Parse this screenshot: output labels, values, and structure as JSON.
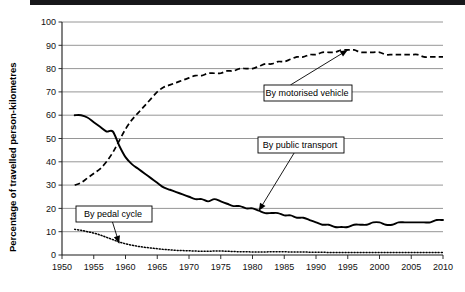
{
  "chart_data": {
    "type": "line",
    "title": "",
    "xlabel": "",
    "ylabel": "Percentage of travelled person-kilometres",
    "xlim": [
      1950,
      2010
    ],
    "ylim": [
      0,
      100
    ],
    "grid": true,
    "legend_position": "inline-annotations",
    "x_ticks": [
      "1950",
      "1955",
      "1960",
      "1965",
      "1970",
      "1975",
      "1980",
      "1985",
      "1990",
      "1995",
      "2000",
      "2005",
      "2010"
    ],
    "y_ticks": [
      "0",
      "10",
      "20",
      "30",
      "40",
      "50",
      "60",
      "70",
      "80",
      "90",
      "100"
    ],
    "annotations": [
      {
        "label": "By motorised vehicle",
        "points_to_year": 1995,
        "points_to_value": 88
      },
      {
        "label": "By public transport",
        "points_to_year": 1981,
        "points_to_value": 19
      },
      {
        "label": "By pedal cycle",
        "points_to_year": 1959,
        "points_to_value": 5
      }
    ],
    "series": [
      {
        "name": "By motorised vehicle",
        "style": "dashed",
        "x": [
          1952,
          1953,
          1954,
          1955,
          1956,
          1957,
          1958,
          1959,
          1960,
          1961,
          1962,
          1963,
          1964,
          1965,
          1966,
          1967,
          1968,
          1969,
          1970,
          1971,
          1972,
          1973,
          1974,
          1975,
          1976,
          1977,
          1978,
          1979,
          1980,
          1981,
          1982,
          1983,
          1984,
          1985,
          1986,
          1987,
          1988,
          1989,
          1990,
          1991,
          1992,
          1993,
          1994,
          1995,
          1996,
          1997,
          1998,
          1999,
          2000,
          2001,
          2002,
          2003,
          2004,
          2005,
          2006,
          2007,
          2008,
          2009,
          2010
        ],
        "values": [
          30,
          31,
          33,
          35,
          37,
          40,
          44,
          49,
          54,
          58,
          61,
          64,
          67,
          70,
          72,
          73,
          74,
          75,
          76,
          77,
          77,
          78,
          78,
          78,
          79,
          79,
          80,
          80,
          80,
          81,
          82,
          82,
          83,
          83,
          84,
          85,
          85,
          86,
          86,
          87,
          87,
          87,
          88,
          88,
          88,
          87,
          87,
          87,
          87,
          86,
          86,
          86,
          86,
          86,
          86,
          85,
          85,
          85,
          85
        ]
      },
      {
        "name": "By public transport",
        "style": "solid",
        "x": [
          1952,
          1953,
          1954,
          1955,
          1956,
          1957,
          1958,
          1959,
          1960,
          1961,
          1962,
          1963,
          1964,
          1965,
          1966,
          1967,
          1968,
          1969,
          1970,
          1971,
          1972,
          1973,
          1974,
          1975,
          1976,
          1977,
          1978,
          1979,
          1980,
          1981,
          1982,
          1983,
          1984,
          1985,
          1986,
          1987,
          1988,
          1989,
          1990,
          1991,
          1992,
          1993,
          1994,
          1995,
          1996,
          1997,
          1998,
          1999,
          2000,
          2001,
          2002,
          2003,
          2004,
          2005,
          2006,
          2007,
          2008,
          2009,
          2010
        ],
        "values": [
          60,
          60,
          59,
          57,
          55,
          53,
          53,
          47,
          42,
          39,
          37,
          35,
          33,
          31,
          29,
          28,
          27,
          26,
          25,
          24,
          24,
          23,
          24,
          23,
          22,
          21,
          21,
          20,
          20,
          19,
          18,
          18,
          18,
          17,
          17,
          16,
          16,
          15,
          14,
          13,
          13,
          12,
          12,
          12,
          13,
          13,
          13,
          14,
          14,
          13,
          13,
          14,
          14,
          14,
          14,
          14,
          14,
          15,
          15
        ]
      },
      {
        "name": "By pedal cycle",
        "style": "dotted",
        "x": [
          1952,
          1953,
          1954,
          1955,
          1956,
          1957,
          1958,
          1959,
          1960,
          1961,
          1962,
          1963,
          1964,
          1965,
          1966,
          1967,
          1968,
          1969,
          1970,
          1971,
          1972,
          1973,
          1974,
          1975,
          1976,
          1977,
          1978,
          1979,
          1980,
          1981,
          1982,
          1983,
          1984,
          1985,
          1986,
          1987,
          1988,
          1989,
          1990,
          1991,
          1992,
          1993,
          1994,
          1995,
          1996,
          1997,
          1998,
          1999,
          2000,
          2001,
          2002,
          2003,
          2004,
          2005,
          2006,
          2007,
          2008,
          2009,
          2010
        ],
        "values": [
          11,
          10.6,
          10,
          9.4,
          8.6,
          7.6,
          6.6,
          5.6,
          4.8,
          4.2,
          3.7,
          3.3,
          3,
          2.7,
          2.4,
          2.2,
          2,
          1.9,
          1.8,
          1.7,
          1.6,
          1.6,
          1.7,
          1.7,
          1.6,
          1.5,
          1.4,
          1.4,
          1.3,
          1.3,
          1.3,
          1.4,
          1.4,
          1.4,
          1.3,
          1.3,
          1.3,
          1.2,
          1.2,
          1.2,
          1.1,
          1.1,
          1.1,
          1.1,
          1.1,
          1.1,
          1.1,
          1.1,
          1.1,
          1.1,
          1.1,
          1.1,
          1.1,
          1.1,
          1.1,
          1.1,
          1.1,
          1.1,
          1.1
        ]
      }
    ]
  }
}
